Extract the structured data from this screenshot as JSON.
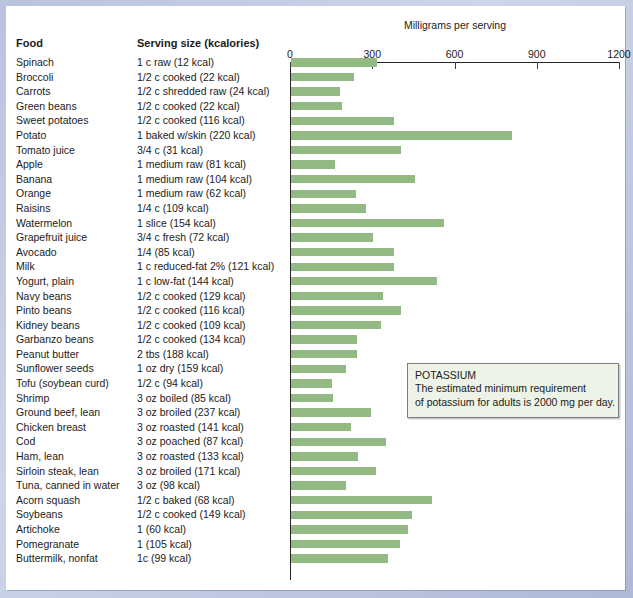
{
  "headers": {
    "food": "Food",
    "serving": "Serving size (kcalories)"
  },
  "axis": {
    "title": "Milligrams per serving",
    "ticks": [
      "0",
      "300",
      "600",
      "900",
      "1200"
    ],
    "min": 0,
    "max": 1200
  },
  "callout": {
    "title": "POTASSIUM",
    "line1": "The estimated minimum requirement",
    "line2": "of potassium for adults is 2000 mg per day."
  },
  "colors": {
    "bar": "#92ba82",
    "page": "#ffffff",
    "frame": "#c5cde4",
    "callout_bg": "#edf3e7",
    "text": "#1b1b1b"
  },
  "chart_data": {
    "type": "bar",
    "orientation": "horizontal",
    "title": "",
    "xlabel": "Milligrams per serving",
    "ylabel": "Food",
    "xlim": [
      0,
      1200
    ],
    "xticks": [
      0,
      300,
      600,
      900,
      1200
    ],
    "grid": false,
    "legend": "none",
    "annotations": [
      "POTASSIUM",
      "The estimated minimum requirement of potassium for adults is 2000 mg per day."
    ],
    "categories": [
      "Spinach",
      "Broccoli",
      "Carrots",
      "Green beans",
      "Sweet potatoes",
      "Potato",
      "Tomato juice",
      "Apple",
      "Banana",
      "Orange",
      "Raisins",
      "Watermelon",
      "Grapefruit juice",
      "Avocado",
      "Milk",
      "Yogurt, plain",
      "Navy beans",
      "Pinto beans",
      "Kidney beans",
      "Garbanzo beans",
      "Peanut butter",
      "Sunflower seeds",
      "Tofu (soybean curd)",
      "Shrimp",
      "Ground beef, lean",
      "Chicken breast",
      "Cod",
      "Ham, lean",
      "Sirloin steak, lean",
      "Tuna, canned in water",
      "Acorn squash",
      "Soybeans",
      "Artichoke",
      "Pomegranate",
      "Buttermilk, nonfat"
    ],
    "values": [
      312,
      228,
      178,
      185,
      376,
      806,
      400,
      159,
      451,
      237,
      272,
      559,
      300,
      374,
      377,
      531,
      335,
      400,
      329,
      239,
      239,
      200,
      150,
      155,
      292,
      220,
      345,
      244,
      311,
      201,
      513,
      443,
      425,
      399,
      352
    ],
    "units": "mg"
  },
  "rows": [
    {
      "food": "Spinach",
      "serving": "1 c raw (12 kcal)",
      "value": 312
    },
    {
      "food": "Broccoli",
      "serving": "1/2 c cooked (22 kcal)",
      "value": 228
    },
    {
      "food": "Carrots",
      "serving": "1/2 c shredded raw (24 kcal)",
      "value": 178
    },
    {
      "food": "Green beans",
      "serving": "1/2 c cooked (22 kcal)",
      "value": 185
    },
    {
      "food": "Sweet potatoes",
      "serving": "1/2 c cooked (116 kcal)",
      "value": 376
    },
    {
      "food": "Potato",
      "serving": "1 baked w/skin (220 kcal)",
      "value": 806
    },
    {
      "food": "Tomato juice",
      "serving": "3/4 c (31 kcal)",
      "value": 400
    },
    {
      "food": "Apple",
      "serving": "1 medium raw (81 kcal)",
      "value": 159
    },
    {
      "food": "Banana",
      "serving": "1 medium raw (104 kcal)",
      "value": 451
    },
    {
      "food": "Orange",
      "serving": "1 medium raw (62 kcal)",
      "value": 237
    },
    {
      "food": "Raisins",
      "serving": "1/4 c (109 kcal)",
      "value": 272
    },
    {
      "food": "Watermelon",
      "serving": "1 slice (154 kcal)",
      "value": 559
    },
    {
      "food": "Grapefruit juice",
      "serving": "3/4 c fresh (72 kcal)",
      "value": 300
    },
    {
      "food": "Avocado",
      "serving": "1/4 (85 kcal)",
      "value": 374
    },
    {
      "food": "Milk",
      "serving": "1 c reduced-fat 2% (121 kcal)",
      "value": 377
    },
    {
      "food": "Yogurt, plain",
      "serving": "1 c low-fat (144 kcal)",
      "value": 531
    },
    {
      "food": "Navy beans",
      "serving": "1/2 c cooked (129 kcal)",
      "value": 335
    },
    {
      "food": "Pinto beans",
      "serving": "1/2 c cooked (116 kcal)",
      "value": 400
    },
    {
      "food": "Kidney beans",
      "serving": "1/2 c cooked (109 kcal)",
      "value": 329
    },
    {
      "food": "Garbanzo beans",
      "serving": "1/2 c cooked (134 kcal)",
      "value": 239
    },
    {
      "food": "Peanut butter",
      "serving": "2 tbs (188 kcal)",
      "value": 239
    },
    {
      "food": "Sunflower seeds",
      "serving": "1 oz dry (159 kcal)",
      "value": 200
    },
    {
      "food": "Tofu (soybean curd)",
      "serving": "1/2 c (94 kcal)",
      "value": 150
    },
    {
      "food": "Shrimp",
      "serving": "3 oz boiled (85 kcal)",
      "value": 155
    },
    {
      "food": "Ground beef, lean",
      "serving": "3 oz broiled (237 kcal)",
      "value": 292
    },
    {
      "food": "Chicken breast",
      "serving": "3 oz roasted (141 kcal)",
      "value": 220
    },
    {
      "food": "Cod",
      "serving": "3 oz poached (87 kcal)",
      "value": 345
    },
    {
      "food": "Ham, lean",
      "serving": "3 oz roasted (133 kcal)",
      "value": 244
    },
    {
      "food": "Sirloin steak, lean",
      "serving": "3 oz broiled (171 kcal)",
      "value": 311
    },
    {
      "food": "Tuna, canned in water",
      "serving": "3 oz (98 kcal)",
      "value": 201
    },
    {
      "food": "Acorn squash",
      "serving": "1/2 c baked (68 kcal)",
      "value": 513
    },
    {
      "food": "Soybeans",
      "serving": "1/2 c cooked (149 kcal)",
      "value": 443
    },
    {
      "food": "Artichoke",
      "serving": "1 (60 kcal)",
      "value": 425
    },
    {
      "food": "Pomegranate",
      "serving": "1 (105 kcal)",
      "value": 399
    },
    {
      "food": "Buttermilk, nonfat",
      "serving": "1c (99 kcal)",
      "value": 352
    }
  ]
}
